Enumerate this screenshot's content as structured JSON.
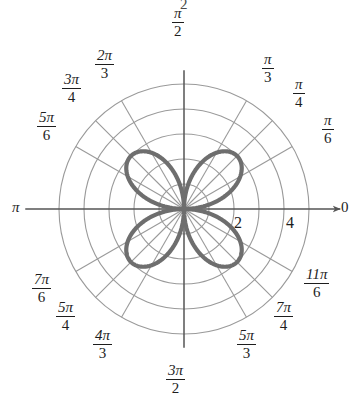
{
  "figure": {
    "kind": "polar-plot",
    "center_px": [
      184,
      209
    ],
    "clipped_top_text": "2",
    "colors": {
      "grid": "#9a9a9a",
      "axis": "#555555",
      "curve": "#6e6e6e",
      "text": "#1d1d1d",
      "background": "#ffffff"
    }
  },
  "angle_labels": [
    {
      "name": "pi-over-2",
      "text": "π/2",
      "num": "π",
      "den": "2",
      "fraction": true,
      "theta_deg": 90,
      "x": 172,
      "y": 6
    },
    {
      "name": "two-pi-over-3",
      "text": "2π/3",
      "num": "2π",
      "den": "3",
      "fraction": true,
      "theta_deg": 120,
      "x": 95,
      "y": 48
    },
    {
      "name": "three-pi-over-4",
      "text": "3π/4",
      "num": "3π",
      "den": "4",
      "fraction": true,
      "theta_deg": 135,
      "x": 62,
      "y": 72
    },
    {
      "name": "five-pi-over-6",
      "text": "5π/6",
      "num": "5π",
      "den": "6",
      "fraction": true,
      "theta_deg": 150,
      "x": 37,
      "y": 110
    },
    {
      "name": "pi",
      "text": "π",
      "num": "π",
      "den": "",
      "fraction": false,
      "theta_deg": 180,
      "x": 12,
      "y": 199
    },
    {
      "name": "seven-pi-over-6",
      "text": "7π/6",
      "num": "7π",
      "den": "6",
      "fraction": true,
      "theta_deg": 210,
      "x": 32,
      "y": 272
    },
    {
      "name": "five-pi-over-4",
      "text": "5π/4",
      "num": "5π",
      "den": "4",
      "fraction": true,
      "theta_deg": 225,
      "x": 56,
      "y": 300
    },
    {
      "name": "four-pi-over-3",
      "text": "4π/3",
      "num": "4π",
      "den": "3",
      "fraction": true,
      "theta_deg": 240,
      "x": 93,
      "y": 328
    },
    {
      "name": "three-pi-over-2",
      "text": "3π/2",
      "num": "3π",
      "den": "2",
      "fraction": true,
      "theta_deg": 270,
      "x": 166,
      "y": 363
    },
    {
      "name": "five-pi-over-3",
      "text": "5π/3",
      "num": "5π",
      "den": "3",
      "fraction": true,
      "theta_deg": 300,
      "x": 237,
      "y": 328
    },
    {
      "name": "seven-pi-over-4",
      "text": "7π/4",
      "num": "7π",
      "den": "4",
      "fraction": true,
      "theta_deg": 315,
      "x": 274,
      "y": 300
    },
    {
      "name": "eleven-pi-over-6",
      "text": "11π/6",
      "num": "11π",
      "den": "6",
      "fraction": true,
      "theta_deg": 330,
      "x": 304,
      "y": 267
    },
    {
      "name": "pi-over-6",
      "text": "π/6",
      "num": "π",
      "den": "6",
      "fraction": true,
      "theta_deg": 30,
      "x": 322,
      "y": 113
    },
    {
      "name": "pi-over-4",
      "text": "π/4",
      "num": "π",
      "den": "4",
      "fraction": true,
      "theta_deg": 45,
      "x": 293,
      "y": 77
    },
    {
      "name": "pi-over-3",
      "text": "π/3",
      "num": "π",
      "den": "3",
      "fraction": true,
      "theta_deg": 60,
      "x": 262,
      "y": 52
    },
    {
      "name": "zero",
      "text": "0",
      "num": "0",
      "den": "",
      "fraction": false,
      "theta_deg": 0,
      "x": 341,
      "y": 199
    }
  ],
  "radial_labels": [
    {
      "name": "radius-2",
      "text": "2",
      "r": 2,
      "x": 234,
      "y": 214
    },
    {
      "name": "radius-4",
      "text": "4",
      "r": 4,
      "x": 286,
      "y": 214
    }
  ],
  "chart_data": {
    "type": "line",
    "coordinate_system": "polar",
    "title": "",
    "xlabel": "",
    "ylabel": "",
    "equation": "r = 3 sin(2θ)",
    "petal_count": 4,
    "petal_max_radius": 3,
    "petal_axis_angles_deg": [
      45,
      135,
      225,
      315
    ],
    "radial_ticks": [
      1,
      2,
      3,
      4,
      5
    ],
    "radial_ticks_labeled": [
      2,
      4
    ],
    "rlim": [
      0,
      5
    ],
    "angular_ticks_deg": [
      0,
      30,
      45,
      60,
      90,
      120,
      135,
      150,
      180,
      210,
      225,
      240,
      270,
      300,
      315,
      330
    ],
    "angular_tick_labels": [
      "0",
      "π/6",
      "π/4",
      "π/3",
      "π/2",
      "2π/3",
      "3π/4",
      "5π/6",
      "π",
      "7π/6",
      "5π/4",
      "4π/3",
      "3π/2",
      "5π/3",
      "7π/4",
      "11π/6"
    ],
    "grid": true,
    "legend": "none",
    "series": [
      {
        "name": "rose",
        "theta_deg": [
          0,
          5,
          10,
          15,
          20,
          25,
          30,
          35,
          40,
          45,
          50,
          55,
          60,
          65,
          70,
          75,
          80,
          85,
          90,
          95,
          100,
          105,
          110,
          115,
          120,
          125,
          130,
          135,
          140,
          145,
          150,
          155,
          160,
          165,
          170,
          175,
          180,
          185,
          190,
          195,
          200,
          205,
          210,
          215,
          220,
          225,
          230,
          235,
          240,
          245,
          250,
          255,
          260,
          265,
          270,
          275,
          280,
          285,
          290,
          295,
          300,
          305,
          310,
          315,
          320,
          325,
          330,
          335,
          340,
          345,
          350,
          355,
          360
        ],
        "r": [
          0.0,
          0.52,
          1.03,
          1.5,
          1.93,
          2.3,
          2.6,
          2.82,
          2.96,
          3.0,
          2.96,
          2.82,
          2.6,
          2.3,
          1.93,
          1.5,
          1.03,
          0.52,
          0.0,
          0.52,
          1.03,
          1.5,
          1.93,
          2.3,
          2.6,
          2.82,
          2.96,
          3.0,
          2.96,
          2.82,
          2.6,
          2.3,
          1.93,
          1.5,
          1.03,
          0.52,
          0.0,
          0.52,
          1.03,
          1.5,
          1.93,
          2.3,
          2.6,
          2.82,
          2.96,
          3.0,
          2.96,
          2.82,
          2.6,
          2.3,
          1.93,
          1.5,
          1.03,
          0.52,
          0.0,
          0.52,
          1.03,
          1.5,
          1.93,
          2.3,
          2.6,
          2.82,
          2.96,
          3.0,
          2.96,
          2.82,
          2.6,
          2.3,
          1.93,
          1.5,
          1.03,
          0.52,
          0.0
        ]
      }
    ]
  }
}
